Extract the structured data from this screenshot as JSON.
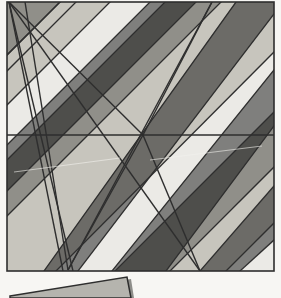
{
  "canvas": {
    "width": 281,
    "height": 298,
    "background": "#ffffff",
    "title": "Abstract geometric composition"
  },
  "palette": {
    "light": "#ebeae6",
    "mid": "#b5b4ae",
    "dark": "#7f7f7d",
    "stroke": "#2e2e2e",
    "background": "#ffffff",
    "page_edge": "#f4f3f0"
  },
  "figure": {
    "name": "main-panel",
    "frame": {
      "left": 7,
      "top": 2,
      "right": 274,
      "bottom": 271
    },
    "stroke_width": 1.4
  },
  "chart_data": {
    "type": "diagram",
    "subtitle": "Interlocking diagonal bands in three grey tones",
    "xlabel": "",
    "ylabel": "",
    "xlim": [
      0,
      281
    ],
    "ylim": [
      0,
      298
    ],
    "grid": false,
    "legend": null,
    "tones": [
      {
        "name": "light",
        "hex": "#ebeae6",
        "share_pct": 42
      },
      {
        "name": "mid",
        "hex": "#b5b4ae",
        "share_pct": 26
      },
      {
        "name": "dark",
        "hex": "#7f7f7d",
        "share_pct": 32
      }
    ],
    "annotations": [
      {
        "label": "top-left fan apex",
        "x": 9,
        "y": 2
      },
      {
        "label": "central star node",
        "x": 143,
        "y": 135
      },
      {
        "label": "bottom fan apex",
        "x": 68,
        "y": 270
      }
    ],
    "polygons": [
      {
        "id": "p01",
        "tone": "light",
        "points": "7,2 60,2 7,55"
      },
      {
        "id": "p02",
        "tone": "light",
        "points": "76,2 150,2 7,145 7,71"
      },
      {
        "id": "p03",
        "tone": "dark",
        "points": "150,2 196,2 7,191 7,145"
      },
      {
        "id": "p04",
        "tone": "light",
        "points": "196,2 236,2 44,271 7,271 7,191"
      },
      {
        "id": "p05",
        "tone": "dark",
        "points": "236,2 274,2 274,14 78,271 44,271"
      },
      {
        "id": "p06",
        "tone": "light",
        "points": "274,14 274,70 78,271 112,271"
      },
      {
        "id": "p07",
        "tone": "dark",
        "points": "274,70 274,126 166,271 112,271"
      },
      {
        "id": "p08",
        "tone": "light",
        "points": "274,126 274,186 200,271 166,271"
      },
      {
        "id": "p09",
        "tone": "dark",
        "points": "274,186 274,240 240,271 200,271"
      },
      {
        "id": "p10",
        "tone": "light",
        "points": "274,240 274,271 240,271"
      },
      {
        "id": "q01",
        "tone": "dark",
        "points": "7,2 7,55 60,2"
      },
      {
        "id": "q02",
        "tone": "mid",
        "points": "7,55 7,105 110,2 60,2"
      },
      {
        "id": "q03",
        "tone": "light",
        "points": "7,105 7,160 165,2 110,2"
      },
      {
        "id": "q04",
        "tone": "dark",
        "points": "7,160 7,216 221,2 165,2"
      },
      {
        "id": "q05",
        "tone": "mid",
        "points": "7,216 7,271 56,271 274,52 274,2 221,2"
      },
      {
        "id": "q06",
        "tone": "light",
        "points": "56,271 115,271 274,112 274,52"
      },
      {
        "id": "q07",
        "tone": "dark",
        "points": "115,271 170,271 274,167 274,112"
      },
      {
        "id": "q08",
        "tone": "mid",
        "points": "170,271 226,271 274,223 274,167"
      },
      {
        "id": "q09",
        "tone": "light",
        "points": "226,271 274,271 274,223"
      }
    ],
    "bands_negative_slope": [
      {
        "index": 0,
        "start": [
          7,
          2
        ],
        "end": [
          7,
          2
        ]
      },
      {
        "index": 1,
        "start": [
          60,
          2
        ],
        "end": [
          7,
          55
        ]
      },
      {
        "index": 2,
        "start": [
          110,
          2
        ],
        "end": [
          7,
          105
        ]
      },
      {
        "index": 3,
        "start": [
          165,
          2
        ],
        "end": [
          7,
          160
        ]
      },
      {
        "index": 4,
        "start": [
          221,
          2
        ],
        "end": [
          7,
          216
        ]
      },
      {
        "index": 5,
        "start": [
          274,
          52
        ],
        "end": [
          56,
          271
        ]
      },
      {
        "index": 6,
        "start": [
          274,
          112
        ],
        "end": [
          115,
          271
        ]
      },
      {
        "index": 7,
        "start": [
          274,
          167
        ],
        "end": [
          170,
          271
        ]
      },
      {
        "index": 8,
        "start": [
          274,
          223
        ],
        "end": [
          226,
          271
        ]
      }
    ],
    "bands_positive_slope": [
      {
        "index": 1,
        "start": [
          76,
          2
        ],
        "end": [
          7,
          71
        ]
      },
      {
        "index": 2,
        "start": [
          150,
          2
        ],
        "end": [
          7,
          145
        ]
      },
      {
        "index": 3,
        "start": [
          196,
          2
        ],
        "end": [
          7,
          191
        ]
      },
      {
        "index": 4,
        "start": [
          236,
          2
        ],
        "end": [
          44,
          271
        ]
      },
      {
        "index": 5,
        "start": [
          274,
          14
        ],
        "end": [
          78,
          271
        ]
      },
      {
        "index": 6,
        "start": [
          274,
          70
        ],
        "end": [
          112,
          271
        ]
      },
      {
        "index": 7,
        "start": [
          274,
          126
        ],
        "end": [
          166,
          271
        ]
      },
      {
        "index": 8,
        "start": [
          274,
          186
        ],
        "end": [
          200,
          271
        ]
      },
      {
        "index": 9,
        "start": [
          274,
          240
        ],
        "end": [
          240,
          271
        ]
      }
    ],
    "fan_top_left": {
      "apex": [
        9,
        2
      ],
      "rays": [
        {
          "to": [
            73,
            271
          ]
        },
        {
          "to": [
            63,
            271
          ]
        },
        {
          "to": [
            143,
            135
          ]
        },
        {
          "to": [
            200,
            271
          ]
        }
      ]
    },
    "fan_bottom": {
      "apex": [
        68,
        270
      ],
      "rays": [
        {
          "to": [
            9,
            2
          ]
        },
        {
          "to": [
            25,
            2
          ]
        },
        {
          "to": [
            143,
            135
          ]
        },
        {
          "to": [
            212,
            2
          ]
        }
      ]
    },
    "horizontal_divider": {
      "y": 135,
      "x_start": 7,
      "x_end": 274
    },
    "star_node_rays": [
      {
        "to": [
          9,
          2
        ]
      },
      {
        "to": [
          68,
          270
        ]
      },
      {
        "to": [
          212,
          2
        ]
      },
      {
        "to": [
          200,
          271
        ]
      },
      {
        "to": [
          7,
          135
        ]
      },
      {
        "to": [
          274,
          135
        ]
      }
    ]
  },
  "inset": {
    "name": "tilted-card",
    "tone": "mid",
    "points": "10,296 127,277 131,298 10,298",
    "shadow_points": "14,298 131,279 134,298",
    "description": "Small tilted grey rectangle peeking in from the bottom edge"
  }
}
